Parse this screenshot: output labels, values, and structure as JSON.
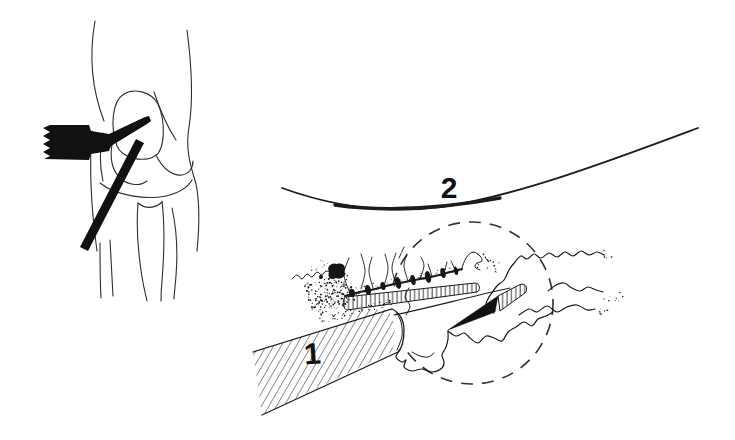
{
  "figure": {
    "background_color": "#ffffff",
    "ink_color": "#1a1a1a",
    "labels": [
      {
        "text": "1"
      },
      {
        "text": "2"
      }
    ],
    "parts": [
      "knee-outline-sketch",
      "arthroscope-silhouette",
      "probe-rod-silhouette",
      "femoral-condyle-curve",
      "magnifier-dashed-circle",
      "hatched-shaft",
      "serrated-cut-edge-strip",
      "scalpel-blade",
      "torn-tissue-squiggles",
      "debris-stipple"
    ]
  }
}
